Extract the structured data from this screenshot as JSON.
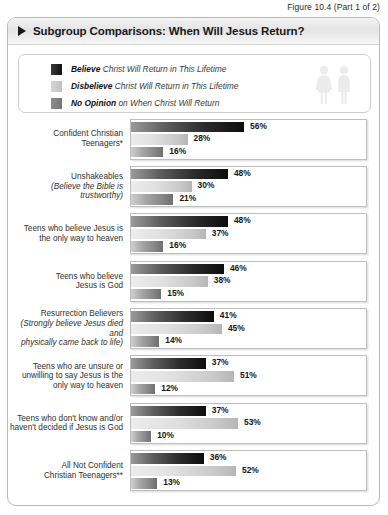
{
  "figure": {
    "caption": "Figure 10.4 (Part 1 of 2)"
  },
  "header": {
    "title": "Subgroup Comparisons: When Will Jesus Return?",
    "bullet_icon": "triangle-right-icon"
  },
  "legend": {
    "people_icon": "two-person-figures-icon",
    "items": [
      {
        "key": "believe",
        "emphasis": "Believe",
        "rest": " Christ Will Return in This Lifetime",
        "color": "#111111"
      },
      {
        "key": "disbelieve",
        "emphasis": "Disbelieve",
        "rest": " Christ Will Return in This Lifetime",
        "color": "#c2c2c2"
      },
      {
        "key": "noopinion",
        "emphasis": "No Opinion",
        "rest": " on When Christ Will Return",
        "color": "#757575"
      }
    ]
  },
  "chart_data": {
    "type": "bar",
    "title": "Subgroup Comparisons: When Will Jesus Return?",
    "orientation": "horizontal",
    "grouped": true,
    "xlabel": "",
    "ylabel": "",
    "xlim": [
      0,
      100
    ],
    "unit": "%",
    "grid": false,
    "legend_position": "top",
    "series": [
      {
        "name": "Believe Christ Will Return in This Lifetime",
        "values": [
          56,
          48,
          48,
          46,
          41,
          37,
          37,
          36
        ]
      },
      {
        "name": "Disbelieve Christ Will Return in This Lifetime",
        "values": [
          28,
          30,
          37,
          38,
          45,
          51,
          53,
          52
        ]
      },
      {
        "name": "No Opinion on When Christ Will Return",
        "values": [
          16,
          21,
          16,
          15,
          14,
          12,
          10,
          13
        ]
      }
    ],
    "categories": [
      "Confident Christian Teenagers*",
      "Unshakeables (Believe the Bible is trustworthy)",
      "Teens who believe Jesus is the only way to heaven",
      "Teens who believe Jesus is God",
      "Resurrection Believers (Strongly believe Jesus died and physically came back to life)",
      "Teens who are unsure or unwilling to say Jesus is the only way to heaven",
      "Teens who don't know and/or haven't decided if Jesus is God",
      "All Not Confident Christian Teenagers**"
    ]
  },
  "groups": [
    {
      "label_main": "Confident Christian\nTeenagers*",
      "label_sub": "",
      "bars": [
        {
          "name": "believe",
          "value": 56,
          "label": "56%"
        },
        {
          "name": "disbelieve",
          "value": 28,
          "label": "28%"
        },
        {
          "name": "noopinion",
          "value": 16,
          "label": "16%"
        }
      ]
    },
    {
      "label_main": "Unshakeables",
      "label_sub": "(Believe the Bible is trustworthy)",
      "bars": [
        {
          "name": "believe",
          "value": 48,
          "label": "48%"
        },
        {
          "name": "disbelieve",
          "value": 30,
          "label": "30%"
        },
        {
          "name": "noopinion",
          "value": 21,
          "label": "21%"
        }
      ]
    },
    {
      "label_main": "Teens who believe Jesus is\nthe only way to heaven",
      "label_sub": "",
      "bars": [
        {
          "name": "believe",
          "value": 48,
          "label": "48%"
        },
        {
          "name": "disbelieve",
          "value": 37,
          "label": "37%"
        },
        {
          "name": "noopinion",
          "value": 16,
          "label": "16%"
        }
      ]
    },
    {
      "label_main": "Teens who believe\nJesus is God",
      "label_sub": "",
      "bars": [
        {
          "name": "believe",
          "value": 46,
          "label": "46%"
        },
        {
          "name": "disbelieve",
          "value": 38,
          "label": "38%"
        },
        {
          "name": "noopinion",
          "value": 15,
          "label": "15%"
        }
      ]
    },
    {
      "label_main": "Resurrection Believers",
      "label_sub": "(Strongly believe Jesus died and\nphysically came back to life)",
      "bars": [
        {
          "name": "believe",
          "value": 41,
          "label": "41%"
        },
        {
          "name": "disbelieve",
          "value": 45,
          "label": "45%"
        },
        {
          "name": "noopinion",
          "value": 14,
          "label": "14%"
        }
      ]
    },
    {
      "label_main": "Teens who are unsure or\nunwilling to say Jesus is the\nonly way to heaven",
      "label_sub": "",
      "bars": [
        {
          "name": "believe",
          "value": 37,
          "label": "37%"
        },
        {
          "name": "disbelieve",
          "value": 51,
          "label": "51%"
        },
        {
          "name": "noopinion",
          "value": 12,
          "label": "12%"
        }
      ]
    },
    {
      "label_main": "Teens who don't know and/or\nhaven't decided if Jesus is God",
      "label_sub": "",
      "bars": [
        {
          "name": "believe",
          "value": 37,
          "label": "37%"
        },
        {
          "name": "disbelieve",
          "value": 53,
          "label": "53%"
        },
        {
          "name": "noopinion",
          "value": 10,
          "label": "10%"
        }
      ]
    },
    {
      "label_main": "All Not Confident\nChristian Teenagers**",
      "label_sub": "",
      "bars": [
        {
          "name": "believe",
          "value": 36,
          "label": "36%"
        },
        {
          "name": "disbelieve",
          "value": 52,
          "label": "52%"
        },
        {
          "name": "noopinion",
          "value": 13,
          "label": "13%"
        }
      ]
    }
  ]
}
